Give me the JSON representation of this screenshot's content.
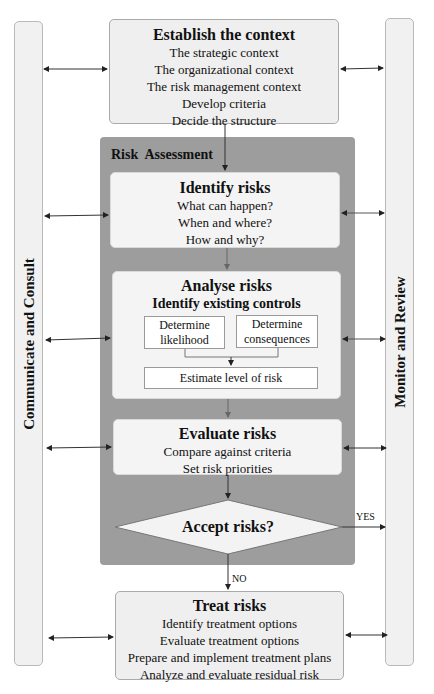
{
  "side_bars": {
    "left": "Communicate and Consult",
    "right": "Monitor and Review"
  },
  "establish": {
    "title": "Establish the context",
    "lines": [
      "The strategic context",
      "The organizational context",
      "The risk management context",
      "Develop criteria",
      "Decide the structure"
    ]
  },
  "assessment": {
    "title": "Risk  Assessment",
    "identify": {
      "title": "Identify risks",
      "lines": [
        "What can happen?",
        "When and where?",
        "How and why?"
      ]
    },
    "analyse": {
      "title": "Analyse risks",
      "subtitle": "Identify existing controls",
      "likelihood": "Determine likelihood",
      "consequences": "Determine consequences",
      "estimate": "Estimate level of risk"
    },
    "evaluate": {
      "title": "Evaluate risks",
      "lines": [
        "Compare against criteria",
        "Set risk priorities"
      ]
    },
    "decision": "Accept risks?"
  },
  "branches": {
    "yes": "YES",
    "no": "NO"
  },
  "treat": {
    "title": "Treat risks",
    "lines": [
      "Identify treatment options",
      "Evaluate treatment options",
      "Prepare and implement treatment plans",
      "Analyze and evaluate residual risk"
    ]
  },
  "colors": {
    "panel": "#9d9d9d",
    "box": "#efefef",
    "side": "#f1f1f1"
  }
}
